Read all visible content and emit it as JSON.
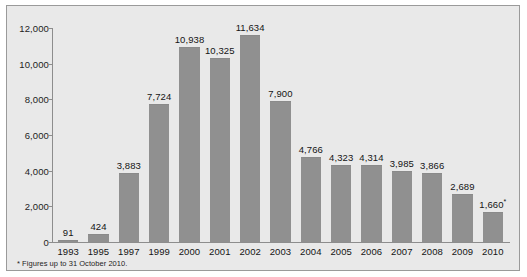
{
  "chart_data": {
    "type": "bar",
    "title": "",
    "subtitle": "",
    "xlabel": "",
    "ylabel": "",
    "categories": [
      "1993",
      "1995",
      "1997",
      "1999",
      "2000",
      "2001",
      "2002",
      "2003",
      "2004",
      "2005",
      "2006",
      "2007",
      "2008",
      "2009",
      "2010"
    ],
    "values": [
      91,
      424,
      3883,
      7724,
      10938,
      10325,
      11634,
      7900,
      4766,
      4323,
      4314,
      3985,
      3866,
      2689,
      1660
    ],
    "value_labels": [
      "91",
      "424",
      "3,883",
      "7,724",
      "10,938",
      "10,325",
      "11,634",
      "7,900",
      "4,766",
      "4,323",
      "4,314",
      "3,985",
      "3,866",
      "2,689",
      "1,660"
    ],
    "ylim": [
      0,
      12000
    ],
    "ytick_values": [
      0,
      2000,
      4000,
      6000,
      8000,
      10000,
      12000
    ],
    "ytick_labels": [
      "0",
      "2,000",
      "4,000",
      "6,000",
      "8,000",
      "10,000",
      "12,000"
    ],
    "grid": false,
    "legend": null,
    "bar_color": "#909090",
    "plot_background": "#e9e9e9",
    "axis_color": "#8d8d8d",
    "annotations": [
      {
        "category": "2010",
        "marker": "*",
        "note": "Figures up to 31 October 2010."
      }
    ]
  },
  "footnote": {
    "text": "* Figures up to 31 October 2010."
  }
}
